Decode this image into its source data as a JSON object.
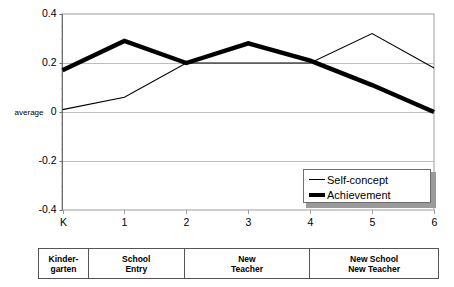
{
  "chart_data": {
    "type": "line",
    "title": "",
    "xlabel": "",
    "ylabel": "",
    "categories": [
      "K",
      "1",
      "2",
      "3",
      "4",
      "5",
      "6"
    ],
    "x_tick_labels": [
      "K",
      "1",
      "2",
      "3",
      "4",
      "5",
      "6"
    ],
    "y_tick_labels": [
      "0.4",
      "0.2",
      "0",
      "-0.2",
      "-0.4"
    ],
    "y_tick_values": [
      0.4,
      0.2,
      0,
      -0.2,
      -0.4
    ],
    "ylim": [
      -0.4,
      0.4
    ],
    "grid": true,
    "legend_position": "bottom-right",
    "zero_line_label": "average",
    "series": [
      {
        "name": "Self-concept",
        "style": "thin",
        "values": [
          0.01,
          0.06,
          0.2,
          0.2,
          0.2,
          0.32,
          0.18
        ]
      },
      {
        "name": "Achievement",
        "style": "thick",
        "values": [
          0.17,
          0.29,
          0.2,
          0.28,
          0.21,
          0.11,
          0.0
        ]
      }
    ]
  },
  "legend": {
    "items": [
      {
        "label": "Self-concept",
        "style": "thin"
      },
      {
        "label": "Achievement",
        "style": "thick"
      }
    ]
  },
  "phase_table": {
    "cells": [
      {
        "line1": "Kinder-",
        "line2": "garten"
      },
      {
        "line1": "School",
        "line2": "Entry"
      },
      {
        "line1": "New",
        "line2": "Teacher"
      },
      {
        "line1": "New School",
        "line2": "New Teacher"
      }
    ]
  }
}
